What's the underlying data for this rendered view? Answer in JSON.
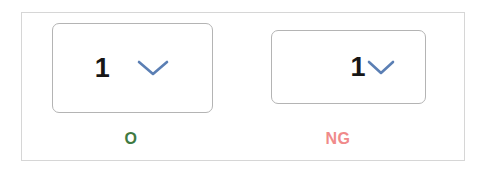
{
  "frame": {
    "border_color": "#d6d6d6",
    "background": "#ffffff"
  },
  "comparison": {
    "columns": [
      {
        "key": "ok",
        "status_label": "O",
        "status_color": "#3f7a42",
        "dropdown": {
          "value": "1",
          "chevron_icon": "chevron-down-icon",
          "chevron_color": "#5b7fb4",
          "border_color": "#b4b4b4",
          "background": "#ffffff"
        }
      },
      {
        "key": "ng",
        "status_label": "NG",
        "status_color": "#f08a8a",
        "dropdown": {
          "value": "1",
          "chevron_icon": "chevron-down-icon",
          "chevron_color": "#5b7fb4",
          "border_color": "#b4b4b4",
          "background": "#ffffff"
        }
      }
    ]
  }
}
